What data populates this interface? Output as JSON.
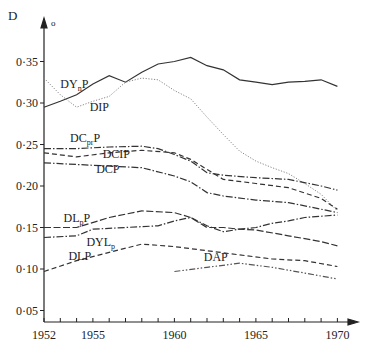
{
  "chart_data": {
    "type": "line",
    "title": "",
    "xlabel": "",
    "ylabel": "D",
    "ylabel_subscript": "o",
    "xlim": [
      1952,
      1970
    ],
    "ylim": [
      0.05,
      0.37
    ],
    "grid": false,
    "legend": "inline labels",
    "x_ticks": [
      1952,
      1953,
      1954,
      1955,
      1956,
      1957,
      1958,
      1959,
      1960,
      1961,
      1962,
      1963,
      1964,
      1965,
      1966,
      1967,
      1968,
      1969,
      1970
    ],
    "x_tick_labels": [
      {
        "year": 1952,
        "label": "1952"
      },
      {
        "year": 1955,
        "label": "1955"
      },
      {
        "year": 1960,
        "label": "1960"
      },
      {
        "year": 1965,
        "label": "1965"
      },
      {
        "year": 1970,
        "label": "1970"
      }
    ],
    "y_ticks": [
      {
        "value": 0.35,
        "label": "0·35"
      },
      {
        "value": 0.3,
        "label": "0·30"
      },
      {
        "value": 0.25,
        "label": "0·25"
      },
      {
        "value": 0.2,
        "label": "0·20"
      },
      {
        "value": 0.15,
        "label": "0·15"
      },
      {
        "value": 0.1,
        "label": "0·10"
      },
      {
        "value": 0.05,
        "label": "0·05"
      }
    ],
    "series": [
      {
        "name": "DYnP",
        "label_main": "DY",
        "label_sub": "n",
        "label_tail": "P",
        "style": "solid",
        "color": "#333333",
        "label_pos": [
          1953.0,
          0.318
        ],
        "points": [
          [
            1952,
            0.295
          ],
          [
            1953,
            0.302
          ],
          [
            1954,
            0.31
          ],
          [
            1955,
            0.323
          ],
          [
            1956,
            0.333
          ],
          [
            1957,
            0.325
          ],
          [
            1958,
            0.337
          ],
          [
            1959,
            0.347
          ],
          [
            1960,
            0.35
          ],
          [
            1961,
            0.355
          ],
          [
            1962,
            0.345
          ],
          [
            1963,
            0.34
          ],
          [
            1964,
            0.328
          ],
          [
            1965,
            0.325
          ],
          [
            1966,
            0.322
          ],
          [
            1967,
            0.325
          ],
          [
            1968,
            0.326
          ],
          [
            1969,
            0.328
          ],
          [
            1970,
            0.32
          ]
        ]
      },
      {
        "name": "DIP",
        "label_main": "DIP",
        "label_sub": "",
        "label_tail": "",
        "style": "dotted",
        "color": "#888888",
        "label_pos": [
          1954.8,
          0.29
        ],
        "points": [
          [
            1952,
            0.33
          ],
          [
            1953,
            0.31
          ],
          [
            1954,
            0.295
          ],
          [
            1955,
            0.302
          ],
          [
            1956,
            0.308
          ],
          [
            1957,
            0.325
          ],
          [
            1958,
            0.33
          ],
          [
            1959,
            0.328
          ],
          [
            1960,
            0.315
          ],
          [
            1961,
            0.305
          ],
          [
            1962,
            0.283
          ],
          [
            1963,
            0.262
          ],
          [
            1964,
            0.242
          ],
          [
            1965,
            0.23
          ],
          [
            1966,
            0.222
          ],
          [
            1967,
            0.215
          ],
          [
            1968,
            0.203
          ],
          [
            1969,
            0.19
          ],
          [
            1970,
            0.17
          ]
        ]
      },
      {
        "name": "DCprP",
        "label_main": "DC",
        "label_sub": "pr",
        "label_tail": "P",
        "style": "dashdot",
        "color": "#333333",
        "label_pos": [
          1953.6,
          0.253
        ],
        "points": [
          [
            1952,
            0.245
          ],
          [
            1954,
            0.245
          ],
          [
            1956,
            0.247
          ],
          [
            1958,
            0.248
          ],
          [
            1959,
            0.245
          ],
          [
            1960,
            0.238
          ],
          [
            1961,
            0.23
          ],
          [
            1962,
            0.216
          ],
          [
            1963,
            0.213
          ],
          [
            1965,
            0.21
          ],
          [
            1967,
            0.208
          ],
          [
            1969,
            0.2
          ],
          [
            1970,
            0.195
          ]
        ]
      },
      {
        "name": "DCIP",
        "label_main": "DCIP",
        "label_sub": "",
        "label_tail": "",
        "style": "dashed",
        "color": "#333333",
        "label_pos": [
          1955.6,
          0.234
        ],
        "points": [
          [
            1952,
            0.24
          ],
          [
            1954,
            0.235
          ],
          [
            1956,
            0.24
          ],
          [
            1958,
            0.243
          ],
          [
            1960,
            0.24
          ],
          [
            1961,
            0.232
          ],
          [
            1962,
            0.22
          ],
          [
            1963,
            0.208
          ],
          [
            1965,
            0.203
          ],
          [
            1967,
            0.198
          ],
          [
            1969,
            0.185
          ],
          [
            1970,
            0.172
          ]
        ]
      },
      {
        "name": "DCP",
        "label_main": "DCP",
        "label_sub": "",
        "label_tail": "",
        "style": "dashdot",
        "color": "#333333",
        "label_pos": [
          1955.2,
          0.216
        ],
        "points": [
          [
            1952,
            0.228
          ],
          [
            1955,
            0.225
          ],
          [
            1958,
            0.222
          ],
          [
            1960,
            0.212
          ],
          [
            1961,
            0.205
          ],
          [
            1962,
            0.192
          ],
          [
            1963,
            0.188
          ],
          [
            1965,
            0.183
          ],
          [
            1967,
            0.18
          ],
          [
            1969,
            0.172
          ],
          [
            1970,
            0.168
          ]
        ]
      },
      {
        "name": "DLpP",
        "label_main": "DL",
        "label_sub": "p",
        "label_tail": "P",
        "style": "dashed-long",
        "color": "#333333",
        "label_pos": [
          1953.2,
          0.157
        ],
        "points": [
          [
            1952,
            0.15
          ],
          [
            1954,
            0.15
          ],
          [
            1956,
            0.162
          ],
          [
            1958,
            0.17
          ],
          [
            1960,
            0.168
          ],
          [
            1961,
            0.162
          ],
          [
            1962,
            0.15
          ],
          [
            1963,
            0.15
          ],
          [
            1964,
            0.148
          ],
          [
            1965,
            0.147
          ],
          [
            1967,
            0.14
          ],
          [
            1969,
            0.133
          ],
          [
            1970,
            0.128
          ]
        ]
      },
      {
        "name": "DYLp",
        "label_main": "DYL",
        "label_sub": "p",
        "label_tail": "",
        "style": "dashdot",
        "color": "#333333",
        "label_pos": [
          1954.6,
          0.128
        ],
        "points": [
          [
            1952,
            0.138
          ],
          [
            1954,
            0.14
          ],
          [
            1955,
            0.148
          ],
          [
            1957,
            0.15
          ],
          [
            1959,
            0.152
          ],
          [
            1960,
            0.158
          ],
          [
            1961,
            0.162
          ],
          [
            1962,
            0.152
          ],
          [
            1963,
            0.145
          ],
          [
            1964,
            0.148
          ],
          [
            1965,
            0.15
          ],
          [
            1966,
            0.155
          ],
          [
            1967,
            0.158
          ],
          [
            1968,
            0.162
          ],
          [
            1970,
            0.165
          ]
        ]
      },
      {
        "name": "DLP",
        "label_main": "DLP",
        "label_sub": "",
        "label_tail": "",
        "style": "dashed",
        "color": "#333333",
        "label_pos": [
          1953.5,
          0.111
        ],
        "points": [
          [
            1952,
            0.097
          ],
          [
            1954,
            0.11
          ],
          [
            1956,
            0.12
          ],
          [
            1958,
            0.13
          ],
          [
            1960,
            0.127
          ],
          [
            1962,
            0.122
          ],
          [
            1964,
            0.117
          ],
          [
            1966,
            0.112
          ],
          [
            1968,
            0.11
          ],
          [
            1970,
            0.103
          ]
        ]
      },
      {
        "name": "DAP",
        "label_main": "DAP",
        "label_sub": "",
        "label_tail": "",
        "style": "dashdotdot",
        "color": "#555555",
        "label_pos": [
          1961.8,
          0.11
        ],
        "points": [
          [
            1960,
            0.097
          ],
          [
            1962,
            0.102
          ],
          [
            1964,
            0.107
          ],
          [
            1966,
            0.102
          ],
          [
            1968,
            0.095
          ],
          [
            1970,
            0.088
          ]
        ]
      }
    ]
  }
}
